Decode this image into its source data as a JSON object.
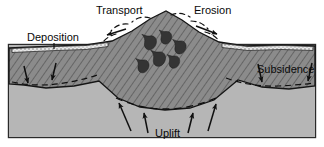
{
  "figure": {
    "type": "geology-cross-section-diagram",
    "width": 324,
    "height": 147
  },
  "labels": {
    "transport": "Transport",
    "erosion": "Erosion",
    "deposition": "Deposition",
    "subsidence": "Subsidence",
    "uplift": "Uplift"
  },
  "colors": {
    "background": "#ffffff",
    "crust_hatched": "#8b8b8b",
    "crust_hatch_line": "#4a4a4a",
    "mantle": "#b6b6b6",
    "sediment_stipple": "#dedede",
    "intrusion": "#3a3a3a",
    "outline": "#151515",
    "text": "#0a0a0a",
    "frame": "#2a2a2a"
  },
  "annotations": {
    "transport_arrow_direction": "left",
    "erosion_arrow_direction": "right",
    "deposition_arrow_count": 2,
    "deposition_arrow_direction": "down",
    "subsidence_arrow_count": 2,
    "subsidence_arrow_direction": "down",
    "uplift_arrow_count": 4,
    "uplift_arrow_direction": "up",
    "intrusion_body_count": 6
  }
}
